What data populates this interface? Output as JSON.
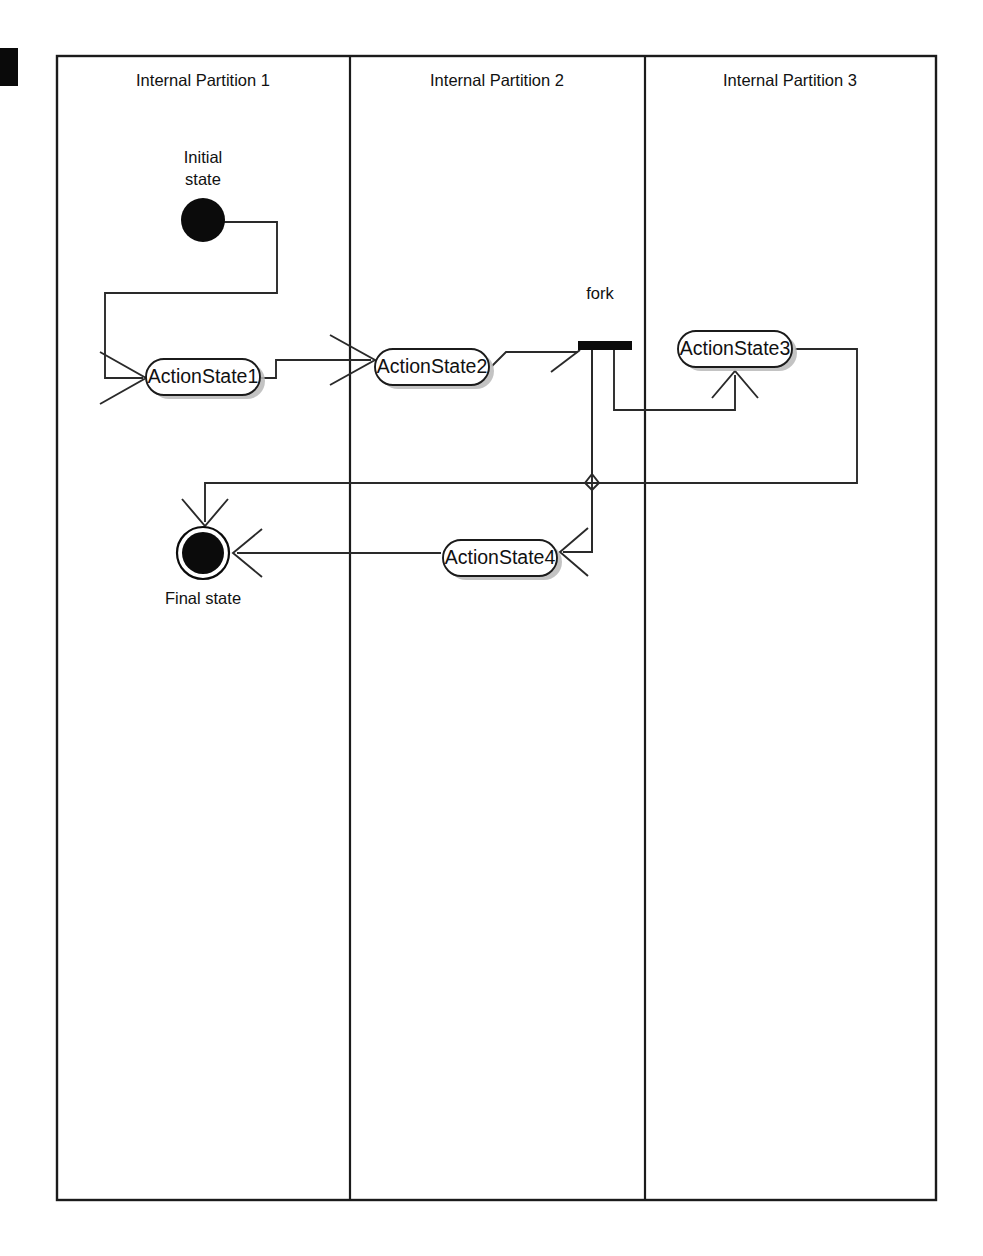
{
  "diagram": {
    "kind": "uml-activity-diagram",
    "partitions": [
      {
        "label": "Internal Partition 1"
      },
      {
        "label": "Internal Partition 2"
      },
      {
        "label": "Internal Partition 3"
      }
    ],
    "nodes": [
      {
        "id": "initial",
        "type": "initial-state",
        "label": "Initial\nstate",
        "label_line_1": "Initial",
        "label_line_2": "state",
        "partition": 1
      },
      {
        "id": "action1",
        "type": "action-state",
        "label": "ActionState1",
        "partition": 1
      },
      {
        "id": "action2",
        "type": "action-state",
        "label": "ActionState2",
        "partition": 2
      },
      {
        "id": "fork",
        "type": "fork-bar",
        "label": "fork",
        "partition": 2
      },
      {
        "id": "action3",
        "type": "action-state",
        "label": "ActionState3",
        "partition": 3
      },
      {
        "id": "action4",
        "type": "action-state",
        "label": "ActionState4",
        "partition": 2
      },
      {
        "id": "final",
        "type": "final-state",
        "label": "Final state",
        "partition": 1
      }
    ],
    "transitions": [
      {
        "from": "initial",
        "to": "action1"
      },
      {
        "from": "action1",
        "to": "action2"
      },
      {
        "from": "action2",
        "to": "fork"
      },
      {
        "from": "fork",
        "to": "action3"
      },
      {
        "from": "fork",
        "to": "action4"
      },
      {
        "from": "action3",
        "to": "final"
      },
      {
        "from": "action4",
        "to": "final"
      }
    ],
    "labels": {
      "initial_state_line_1": "Initial",
      "initial_state_line_2": "state",
      "final_state": "Final state",
      "fork": "fork",
      "action_state_1": "ActionState1",
      "action_state_2": "ActionState2",
      "action_state_3": "ActionState3",
      "action_state_4": "ActionState4"
    },
    "colors": {
      "stroke": "#1b1b1b",
      "flow": "#2a2a2a",
      "node_fill": "#ffffff",
      "node_shadow": "#b9b9b9",
      "solid_black": "#0b0b0b",
      "page_background": "#ffffff"
    }
  }
}
